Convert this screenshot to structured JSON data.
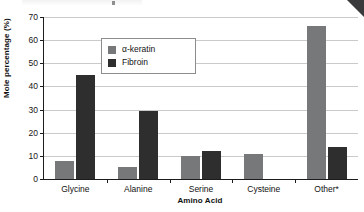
{
  "page": {
    "corner_fold_color": "#3a3a3c"
  },
  "chart_data": {
    "type": "bar",
    "title": "",
    "subtitle": "",
    "xlabel": "Amino Acid",
    "ylabel": "Mole percentage (%)",
    "ylim": [
      0,
      70
    ],
    "ytick_labels": [
      "0",
      "10",
      "20",
      "30",
      "40",
      "50",
      "60",
      "70"
    ],
    "ytick_values": [
      0,
      10,
      20,
      30,
      40,
      50,
      60,
      70
    ],
    "grid": true,
    "grid_axis": "y",
    "legend_position": "upper-left-inside",
    "categories": [
      "Glycine",
      "Alanine",
      "Serine",
      "Cysteine",
      "Other*"
    ],
    "series": [
      {
        "name": "α-keratin",
        "color": "#76787a",
        "values": [
          8,
          5,
          10,
          11,
          66
        ]
      },
      {
        "name": "Fibroin",
        "color": "#2e2e2e",
        "values": [
          45,
          29.5,
          12,
          0,
          14
        ]
      }
    ],
    "annotations": []
  }
}
